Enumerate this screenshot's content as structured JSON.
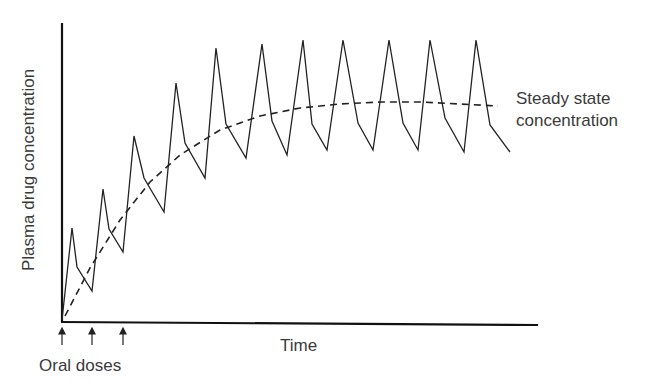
{
  "chart_data": {
    "type": "line",
    "title": "",
    "xlabel": "Time",
    "ylabel": "Plasma drug concentration",
    "grid": false,
    "ticks": "none",
    "annotations": {
      "dose_markers_label": "Oral doses",
      "dose_marker_count": 3,
      "steady_state_label_line1": "Steady state",
      "steady_state_label_line2": "concentration"
    },
    "series": [
      {
        "name": "Plasma concentration (repeated oral dosing)",
        "style": "solid",
        "points_px": [
          [
            62,
            320
          ],
          [
            72,
            228
          ],
          [
            77,
            267
          ],
          [
            92,
            291
          ],
          [
            103,
            189
          ],
          [
            109,
            229
          ],
          [
            123,
            252
          ],
          [
            134,
            136
          ],
          [
            144,
            178
          ],
          [
            164,
            212
          ],
          [
            176,
            83
          ],
          [
            185,
            143
          ],
          [
            205,
            178
          ],
          [
            216,
            48
          ],
          [
            226,
            124
          ],
          [
            246,
            158
          ],
          [
            262,
            44
          ],
          [
            272,
            121
          ],
          [
            287,
            155
          ],
          [
            303,
            40
          ],
          [
            312,
            124
          ],
          [
            327,
            150
          ],
          [
            343,
            40
          ],
          [
            358,
            123
          ],
          [
            373,
            150
          ],
          [
            389,
            40
          ],
          [
            403,
            123
          ],
          [
            418,
            150
          ],
          [
            430,
            40
          ],
          [
            445,
            118
          ],
          [
            464,
            152
          ],
          [
            476,
            40
          ],
          [
            490,
            125
          ],
          [
            510,
            152
          ]
        ]
      },
      {
        "name": "Steady state concentration trend",
        "style": "dashed",
        "points_px": [
          [
            65,
            316
          ],
          [
            90,
            268
          ],
          [
            120,
            220
          ],
          [
            150,
            182
          ],
          [
            180,
            155
          ],
          [
            220,
            130
          ],
          [
            260,
            116
          ],
          [
            300,
            108
          ],
          [
            340,
            104
          ],
          [
            380,
            102
          ],
          [
            420,
            102
          ],
          [
            460,
            104
          ],
          [
            498,
            106
          ]
        ]
      }
    ],
    "relative_values": {
      "peaks": [
        0.31,
        0.44,
        0.62,
        0.8,
        0.92,
        0.93,
        0.94,
        0.94,
        0.94,
        0.94,
        0.94
      ],
      "troughs": [
        0.1,
        0.23,
        0.37,
        0.48,
        0.55,
        0.56,
        0.58,
        0.58,
        0.58,
        0.57
      ],
      "steady_state_level": 0.74
    }
  },
  "labels": {
    "ylabel": "Plasma drug concentration",
    "xlabel": "Time",
    "doses": "Oral doses",
    "steady_line1": "Steady state",
    "steady_line2": "concentration"
  }
}
